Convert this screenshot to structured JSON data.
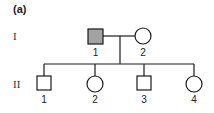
{
  "panel_label": "(a)",
  "generations": [
    {
      "label": "I",
      "members": [
        {
          "id": "1",
          "sex": "male",
          "affected": true
        },
        {
          "id": "2",
          "sex": "female",
          "affected": false
        }
      ]
    },
    {
      "label": "II",
      "members": [
        {
          "id": "1",
          "sex": "male",
          "affected": false
        },
        {
          "id": "2",
          "sex": "female",
          "affected": false
        },
        {
          "id": "3",
          "sex": "male",
          "affected": false
        },
        {
          "id": "4",
          "sex": "female",
          "affected": false
        }
      ]
    }
  ],
  "colors": {
    "affected_fill": "#a3a3a3",
    "unaffected_fill": "#ffffff",
    "line": "#1a1a1a"
  }
}
